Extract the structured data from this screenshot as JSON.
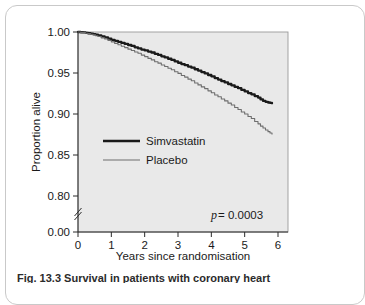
{
  "figure": {
    "caption_label": "Fig. 13.3",
    "caption_text": "Survival in patients with coronary heart"
  },
  "chart_data": {
    "type": "line",
    "title": "",
    "xlabel": "Years since randomisation",
    "ylabel": "Proportion alive",
    "xlim": [
      0,
      6
    ],
    "ylim": [
      0.78,
      1.0
    ],
    "y_axis_break": true,
    "y_break_below": 0.8,
    "xticks": [
      0,
      1,
      2,
      3,
      4,
      5,
      6
    ],
    "xticklabels": [
      "0",
      "1",
      "2",
      "3",
      "4",
      "5",
      "6"
    ],
    "yticks": [
      1.0,
      0.95,
      0.9,
      0.85,
      0.8,
      0.0
    ],
    "yticklabels": [
      "1.00",
      "0.95",
      "0.90",
      "0.85",
      "0.80",
      "0.00"
    ],
    "grid": false,
    "plot_background": "#e9e9e9",
    "legend_position": "center-left",
    "annotations": [
      {
        "name": "p-value",
        "text_italic": "p",
        "text": " = 0.0003",
        "x": 4.3,
        "y": 0.807
      }
    ],
    "series": [
      {
        "name": "Simvastatin",
        "color": "#1a1a1a",
        "linewidth": 2.3,
        "x": [
          0.0,
          0.15,
          0.3,
          0.45,
          0.6,
          0.8,
          1.0,
          1.2,
          1.4,
          1.6,
          1.8,
          2.0,
          2.2,
          2.4,
          2.6,
          2.8,
          3.0,
          3.2,
          3.4,
          3.6,
          3.8,
          4.0,
          4.2,
          4.4,
          4.6,
          4.8,
          5.0,
          5.2,
          5.4,
          5.55,
          5.7,
          5.82
        ],
        "y": [
          1.0,
          0.9995,
          0.9985,
          0.9975,
          0.996,
          0.9935,
          0.9905,
          0.988,
          0.9855,
          0.983,
          0.98,
          0.9775,
          0.975,
          0.972,
          0.969,
          0.966,
          0.9625,
          0.9595,
          0.9565,
          0.953,
          0.9495,
          0.946,
          0.942,
          0.9385,
          0.935,
          0.9315,
          0.9275,
          0.924,
          0.92,
          0.916,
          0.914,
          0.913
        ]
      },
      {
        "name": "Placebo",
        "color": "#6e6e6e",
        "linewidth": 1.1,
        "x": [
          0.0,
          0.15,
          0.3,
          0.45,
          0.6,
          0.8,
          1.0,
          1.2,
          1.4,
          1.6,
          1.8,
          2.0,
          2.2,
          2.4,
          2.6,
          2.8,
          3.0,
          3.2,
          3.4,
          3.6,
          3.8,
          4.0,
          4.2,
          4.4,
          4.6,
          4.8,
          5.0,
          5.2,
          5.4,
          5.55,
          5.7,
          5.82
        ],
        "y": [
          1.0,
          0.9992,
          0.998,
          0.9965,
          0.9945,
          0.9915,
          0.988,
          0.9845,
          0.981,
          0.9775,
          0.974,
          0.97,
          0.966,
          0.962,
          0.958,
          0.954,
          0.9495,
          0.945,
          0.9405,
          0.9355,
          0.931,
          0.926,
          0.921,
          0.916,
          0.911,
          0.9055,
          0.9,
          0.8945,
          0.888,
          0.883,
          0.8785,
          0.8755
        ]
      }
    ]
  },
  "legend": {
    "items": [
      {
        "label": "Simvastatin",
        "style": "thick"
      },
      {
        "label": "Placebo",
        "style": "thin"
      }
    ]
  },
  "colors": {
    "simvastatin": "#1a1a1a",
    "placebo": "#6e6e6e",
    "plot_bg": "#e9e9e9",
    "card_border": "#c9c9c9",
    "text": "#1a1a1a"
  }
}
